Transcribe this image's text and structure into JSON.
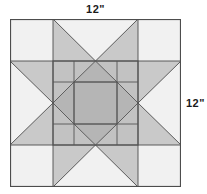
{
  "figure": {
    "kind": "quilt-block-diagram",
    "name": "Nested sawtooth star quilt block",
    "labels": {
      "top": "12\"",
      "right": "12\""
    }
  },
  "chart_data": {
    "type": "diagram",
    "title": "",
    "subtitle": "",
    "xlabel": "12\"",
    "ylabel": "12\"",
    "grid": false,
    "legend": null,
    "annotations": [
      {
        "text": "12\"",
        "position": "top-center"
      },
      {
        "text": "12\"",
        "position": "right-middle"
      }
    ],
    "block": {
      "width_inches": 12,
      "height_inches": 12,
      "units_across": 4,
      "structure": "star-within-a-star",
      "outer_star": {
        "corner_squares": 4,
        "point_units": 4,
        "center_unit": 1
      },
      "inner_star": {
        "corner_squares": 4,
        "point_units": 4,
        "center_square": 1
      }
    },
    "geometry": {
      "block_x": 0,
      "block_y": 0,
      "block_w": 171,
      "block_h": 168,
      "outer_grid_x": [
        0,
        43,
        128,
        171
      ],
      "outer_grid_y": [
        0,
        42,
        126,
        168
      ],
      "inner_grid_x": [
        43,
        64,
        107,
        128
      ],
      "inner_grid_y": [
        42,
        63,
        105,
        126
      ]
    },
    "colors": {
      "background": "#ffffff",
      "light": "#f1f1f1",
      "light_alt": "#e9e9e9",
      "mid": "#c9c9c9",
      "mid_alt": "#c2c2c2",
      "dark": "#b5b5b5",
      "outline": "#4d4d4d",
      "outline_inner": "#555555",
      "label": "#1a1a1a"
    }
  }
}
